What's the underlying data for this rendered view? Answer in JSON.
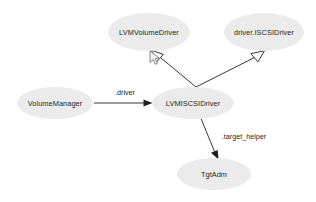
{
  "diagram": {
    "type": "uml-class-relationship-graph",
    "background_color": "#ffffff",
    "node_fill_color": "#ebebeb",
    "text_color": "#231f20",
    "edge_color": "#231f20",
    "nodes": [
      {
        "id": "lvm-volume-driver",
        "label": "LVMVolumeDriver",
        "cx": 149,
        "cy": 32,
        "rx": 41,
        "ry": 19
      },
      {
        "id": "driver-iscsi-driver",
        "label": "driver.ISCSIDriver",
        "cx": 264,
        "cy": 32,
        "rx": 40,
        "ry": 19
      },
      {
        "id": "volume-manager",
        "label": "VolumeManager",
        "cx": 55,
        "cy": 103,
        "rx": 38,
        "ry": 16
      },
      {
        "id": "lvm-iscsi-driver",
        "label": "LVMISCSIDriver",
        "cx": 193,
        "cy": 103,
        "rx": 41,
        "ry": 16
      },
      {
        "id": "tgt-adm",
        "label": "TgtAdm",
        "cx": 214,
        "cy": 174,
        "rx": 37,
        "ry": 16
      }
    ],
    "edges": [
      {
        "id": "inherit-lvm-volume-driver",
        "from": "lvm-iscsi-driver",
        "to": "lvm-volume-driver",
        "label": "",
        "arrow": "hollow-triangle",
        "relation": "generalization"
      },
      {
        "id": "inherit-driver-iscsi-driver",
        "from": "lvm-iscsi-driver",
        "to": "driver-iscsi-driver",
        "label": "",
        "arrow": "hollow-triangle",
        "relation": "generalization"
      },
      {
        "id": "assoc-driver",
        "from": "volume-manager",
        "to": "lvm-iscsi-driver",
        "label": ".driver",
        "label_x": 125,
        "label_y": 92,
        "arrow": "solid-arrow",
        "relation": "association"
      },
      {
        "id": "assoc-target-helper",
        "from": "lvm-iscsi-driver",
        "to": "tgt-adm",
        "label": ".target_helper",
        "label_x": 244,
        "label_y": 136,
        "arrow": "solid-arrow",
        "relation": "association"
      }
    ],
    "cursor": {
      "name": "mouse-pointer",
      "x": 150,
      "y": 52
    }
  }
}
